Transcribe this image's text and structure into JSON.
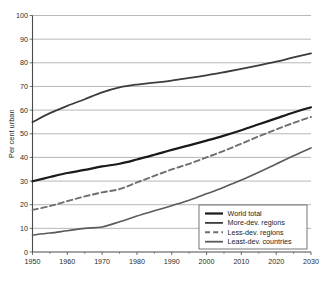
{
  "chart_data": {
    "type": "line",
    "title": "",
    "xlabel": "",
    "ylabel": "Per cent urban",
    "xlim": [
      1950,
      2030
    ],
    "ylim": [
      0,
      100
    ],
    "ytick_step": 10,
    "xtick_step": 10,
    "x_minor_step": 5,
    "grid": "horizontal",
    "legend_position": "bottom-right",
    "xticks": [
      "1950",
      "1960",
      "1970",
      "1980",
      "1990",
      "2000",
      "2010",
      "2020",
      "2030"
    ],
    "yticks": [
      "0",
      "10",
      "20",
      "30",
      "40",
      "50",
      "60",
      "70",
      "80",
      "90",
      "100"
    ],
    "x": [
      1950,
      1955,
      1960,
      1965,
      1970,
      1975,
      1980,
      1985,
      1990,
      1995,
      2000,
      2005,
      2010,
      2015,
      2020,
      2025,
      2030
    ],
    "series": [
      {
        "name": "World total",
        "style": "solid",
        "color": "#1a1a1a",
        "width": 2.2,
        "values": [
          29.9,
          31.7,
          33.4,
          34.7,
          36.2,
          37.3,
          39.1,
          41.1,
          43.2,
          45.1,
          47.1,
          49.2,
          51.5,
          54.0,
          56.5,
          59.0,
          61.2
        ]
      },
      {
        "name": "More-dev. regions",
        "style": "solid",
        "color": "#3c3c3c",
        "width": 1.8,
        "values": [
          54.9,
          58.7,
          61.8,
          64.6,
          67.5,
          69.6,
          70.8,
          71.6,
          72.5,
          73.6,
          74.7,
          76.0,
          77.4,
          78.9,
          80.5,
          82.3,
          84.0
        ]
      },
      {
        "name": "Less-dev. regions",
        "style": "dashed",
        "color": "#6e6e6e",
        "width": 1.9,
        "values": [
          17.8,
          19.4,
          21.5,
          23.5,
          25.2,
          26.6,
          29.4,
          32.2,
          34.9,
          37.3,
          40.0,
          42.8,
          45.8,
          48.9,
          51.8,
          54.6,
          57.1
        ]
      },
      {
        "name": "Least-dev. countries",
        "style": "solid",
        "color": "#5a5a5a",
        "width": 1.6,
        "values": [
          7.2,
          8.0,
          9.0,
          10.0,
          10.6,
          12.8,
          15.2,
          17.4,
          19.6,
          21.9,
          24.6,
          27.4,
          30.4,
          33.7,
          37.2,
          40.7,
          44.0
        ]
      }
    ]
  },
  "legend": {
    "items": [
      {
        "label": "World total"
      },
      {
        "label": "More-dev. regions"
      },
      {
        "label": "Less-dev. regions"
      },
      {
        "label": "Least-dev. countries"
      }
    ]
  }
}
